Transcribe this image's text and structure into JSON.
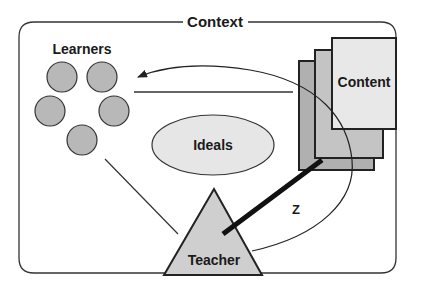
{
  "frame": {
    "label": "Context"
  },
  "learners": {
    "label": "Learners",
    "count": 5
  },
  "ideals": {
    "label": "Ideals"
  },
  "teacher": {
    "label": "Teacher"
  },
  "content": {
    "label": "Content",
    "page_count": 3
  },
  "z_link": {
    "label": "Z"
  },
  "colors": {
    "stroke": "#222222",
    "learner_fill": "#b8b8b8",
    "ideals_fill": "#e6e6e6",
    "teacher_fill": "#cfcfcf",
    "page_back_fill": "#b0b0b0",
    "page_mid_fill": "#c4c4c4",
    "page_front_fill": "#e8e8e8"
  }
}
